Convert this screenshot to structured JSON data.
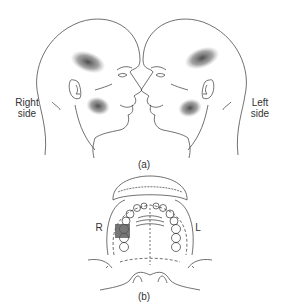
{
  "figure": {
    "panel_a": {
      "caption": "(a)",
      "right_label_line1": "Right",
      "right_label_line2": "side",
      "left_label_line1": "Left",
      "left_label_line2": "side",
      "heads": [
        {
          "facing": "right",
          "pain_areas": [
            "temporal",
            "cheek/masseter"
          ]
        },
        {
          "facing": "left",
          "pain_areas": [
            "temporal",
            "cheek/masseter"
          ]
        }
      ]
    },
    "panel_b": {
      "caption": "(b)",
      "label_r": "R",
      "label_l": "L",
      "highlight": "right maxillary molar region"
    },
    "colors": {
      "line": "#333333",
      "shading": "#555555",
      "background": "#ffffff"
    }
  }
}
